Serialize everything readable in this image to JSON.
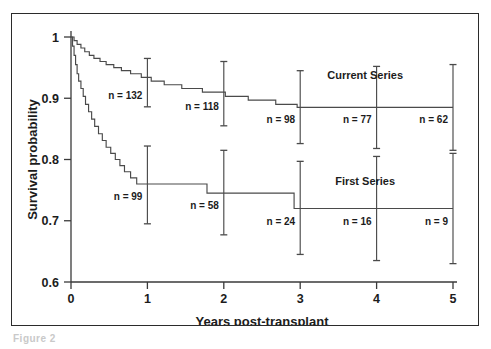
{
  "figure": {
    "caption": "Figure 2",
    "background_color": "#ffffff",
    "frame_color": "#2b2b2b",
    "ink_color": "#4a4a4a"
  },
  "chart_data": {
    "type": "line",
    "title": "",
    "subtitle": "",
    "xlabel": "Years post-transplant",
    "ylabel": "Survival probability",
    "xlim": [
      0,
      5
    ],
    "ylim": [
      0.6,
      1.0
    ],
    "xticks": [
      0,
      1,
      2,
      3,
      4,
      5
    ],
    "xtick_labels": [
      "0",
      "1",
      "2",
      "3",
      "4",
      "5"
    ],
    "yticks": [
      0.6,
      0.7,
      0.8,
      0.9,
      1.0
    ],
    "ytick_labels": [
      "0.6",
      "0.7",
      "0.8",
      "0.9",
      "1"
    ],
    "grid": false,
    "legend_position": "inline-right",
    "series": [
      {
        "name": "Current Series",
        "label_x": 3.85,
        "label_y": 0.932,
        "steps": [
          [
            0.0,
            1.0
          ],
          [
            0.04,
            1.0
          ],
          [
            0.04,
            0.994
          ],
          [
            0.08,
            0.994
          ],
          [
            0.08,
            0.988
          ],
          [
            0.13,
            0.988
          ],
          [
            0.13,
            0.982
          ],
          [
            0.18,
            0.982
          ],
          [
            0.18,
            0.976
          ],
          [
            0.24,
            0.976
          ],
          [
            0.24,
            0.97
          ],
          [
            0.3,
            0.97
          ],
          [
            0.3,
            0.965
          ],
          [
            0.38,
            0.965
          ],
          [
            0.38,
            0.96
          ],
          [
            0.46,
            0.96
          ],
          [
            0.46,
            0.955
          ],
          [
            0.56,
            0.955
          ],
          [
            0.56,
            0.95
          ],
          [
            0.66,
            0.95
          ],
          [
            0.66,
            0.945
          ],
          [
            0.78,
            0.945
          ],
          [
            0.78,
            0.94
          ],
          [
            0.92,
            0.94
          ],
          [
            0.92,
            0.934
          ],
          [
            1.05,
            0.934
          ],
          [
            1.05,
            0.928
          ],
          [
            1.22,
            0.928
          ],
          [
            1.22,
            0.922
          ],
          [
            1.45,
            0.922
          ],
          [
            1.45,
            0.916
          ],
          [
            1.72,
            0.916
          ],
          [
            1.72,
            0.91
          ],
          [
            2.02,
            0.91
          ],
          [
            2.02,
            0.903
          ],
          [
            2.32,
            0.903
          ],
          [
            2.32,
            0.897
          ],
          [
            2.68,
            0.897
          ],
          [
            2.68,
            0.89
          ],
          [
            2.96,
            0.89
          ],
          [
            2.96,
            0.885
          ],
          [
            5.0,
            0.885
          ]
        ],
        "errorbars": [
          {
            "x": 1.0,
            "y": 0.925,
            "low": 0.886,
            "high": 0.965,
            "n_label": "n = 132",
            "n_value": 132
          },
          {
            "x": 2.0,
            "y": 0.907,
            "low": 0.855,
            "high": 0.96,
            "n_label": "n = 118",
            "n_value": 118
          },
          {
            "x": 3.0,
            "y": 0.885,
            "low": 0.826,
            "high": 0.945,
            "n_label": "n = 98",
            "n_value": 98
          },
          {
            "x": 4.0,
            "y": 0.885,
            "low": 0.818,
            "high": 0.952,
            "n_label": "n = 77",
            "n_value": 77
          },
          {
            "x": 5.0,
            "y": 0.885,
            "low": 0.815,
            "high": 0.955,
            "n_label": "n = 62",
            "n_value": 62
          }
        ]
      },
      {
        "name": "First Series",
        "label_x": 3.85,
        "label_y": 0.758,
        "steps": [
          [
            0.0,
            1.0
          ],
          [
            0.02,
            1.0
          ],
          [
            0.02,
            0.985
          ],
          [
            0.04,
            0.985
          ],
          [
            0.04,
            0.97
          ],
          [
            0.06,
            0.97
          ],
          [
            0.06,
            0.955
          ],
          [
            0.08,
            0.955
          ],
          [
            0.08,
            0.94
          ],
          [
            0.1,
            0.94
          ],
          [
            0.1,
            0.928
          ],
          [
            0.13,
            0.928
          ],
          [
            0.13,
            0.916
          ],
          [
            0.16,
            0.916
          ],
          [
            0.16,
            0.903
          ],
          [
            0.19,
            0.903
          ],
          [
            0.19,
            0.89
          ],
          [
            0.23,
            0.89
          ],
          [
            0.23,
            0.878
          ],
          [
            0.27,
            0.878
          ],
          [
            0.27,
            0.866
          ],
          [
            0.31,
            0.866
          ],
          [
            0.31,
            0.854
          ],
          [
            0.36,
            0.854
          ],
          [
            0.36,
            0.842
          ],
          [
            0.41,
            0.842
          ],
          [
            0.41,
            0.831
          ],
          [
            0.46,
            0.831
          ],
          [
            0.46,
            0.82
          ],
          [
            0.52,
            0.82
          ],
          [
            0.52,
            0.81
          ],
          [
            0.58,
            0.81
          ],
          [
            0.58,
            0.8
          ],
          [
            0.64,
            0.8
          ],
          [
            0.64,
            0.79
          ],
          [
            0.7,
            0.79
          ],
          [
            0.7,
            0.78
          ],
          [
            0.78,
            0.78
          ],
          [
            0.78,
            0.77
          ],
          [
            0.86,
            0.77
          ],
          [
            0.86,
            0.76
          ],
          [
            1.78,
            0.76
          ],
          [
            1.78,
            0.745
          ],
          [
            2.92,
            0.745
          ],
          [
            2.92,
            0.72
          ],
          [
            5.0,
            0.72
          ]
        ],
        "errorbars": [
          {
            "x": 1.0,
            "y": 0.76,
            "low": 0.695,
            "high": 0.822,
            "n_label": "n = 99",
            "n_value": 99
          },
          {
            "x": 2.0,
            "y": 0.745,
            "low": 0.677,
            "high": 0.815,
            "n_label": "n = 58",
            "n_value": 58
          },
          {
            "x": 3.0,
            "y": 0.72,
            "low": 0.645,
            "high": 0.797,
            "n_label": "n = 24",
            "n_value": 24
          },
          {
            "x": 4.0,
            "y": 0.72,
            "low": 0.635,
            "high": 0.805,
            "n_label": "n = 16",
            "n_value": 16
          },
          {
            "x": 5.0,
            "y": 0.72,
            "low": 0.63,
            "high": 0.81,
            "n_label": "n = 9",
            "n_value": 9
          }
        ]
      }
    ]
  }
}
